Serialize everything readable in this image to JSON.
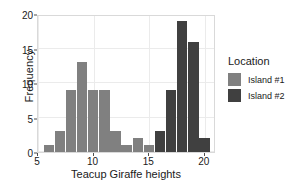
{
  "chart_data": {
    "type": "bar",
    "title": "",
    "subtitle": "",
    "xlabel": "Teacup Giraffe heights",
    "ylabel": "Frequency",
    "xlim": [
      5,
      21
    ],
    "ylim": [
      0,
      20
    ],
    "xticks": [
      5,
      10,
      15,
      20
    ],
    "yticks": [
      0,
      5,
      10,
      15,
      20
    ],
    "xtick_labels": [
      "5",
      "10",
      "15",
      "20"
    ],
    "ytick_labels": [
      "0",
      "5",
      "10",
      "15",
      "20"
    ],
    "grid": true,
    "bin_width": 1,
    "legend": {
      "title": "Location",
      "position": "right",
      "entries": [
        {
          "label": "Island #1",
          "color": "#808080"
        },
        {
          "label": "Island #2",
          "color": "#404040"
        }
      ]
    },
    "series": [
      {
        "name": "Island #1",
        "color": "#808080",
        "bins": [
          {
            "x0": 5.5,
            "x1": 6.5,
            "center": 6,
            "value": 1
          },
          {
            "x0": 6.5,
            "x1": 7.5,
            "center": 7,
            "value": 3
          },
          {
            "x0": 7.5,
            "x1": 8.5,
            "center": 8,
            "value": 9
          },
          {
            "x0": 8.5,
            "x1": 9.5,
            "center": 9,
            "value": 13
          },
          {
            "x0": 9.5,
            "x1": 10.5,
            "center": 10,
            "value": 9
          },
          {
            "x0": 10.5,
            "x1": 11.5,
            "center": 11,
            "value": 9
          },
          {
            "x0": 11.5,
            "x1": 12.5,
            "center": 12,
            "value": 3
          },
          {
            "x0": 12.5,
            "x1": 13.5,
            "center": 13,
            "value": 1
          },
          {
            "x0": 13.5,
            "x1": 14.5,
            "center": 14,
            "value": 2
          },
          {
            "x0": 14.5,
            "x1": 15.5,
            "center": 15,
            "value": 1
          }
        ]
      },
      {
        "name": "Island #2",
        "color": "#404040",
        "bins": [
          {
            "x0": 15.5,
            "x1": 16.5,
            "center": 16,
            "value": 3
          },
          {
            "x0": 16.5,
            "x1": 17.5,
            "center": 17,
            "value": 9
          },
          {
            "x0": 17.5,
            "x1": 18.5,
            "center": 18,
            "value": 19
          },
          {
            "x0": 18.5,
            "x1": 19.5,
            "center": 19,
            "value": 16
          },
          {
            "x0": 19.5,
            "x1": 20.5,
            "center": 20,
            "value": 2
          }
        ]
      }
    ],
    "colors": {
      "panel_background": "#ffffff",
      "gridline": "#ebebeb",
      "panel_border": "#d9d9d9",
      "text": "#1a1a1a"
    }
  }
}
